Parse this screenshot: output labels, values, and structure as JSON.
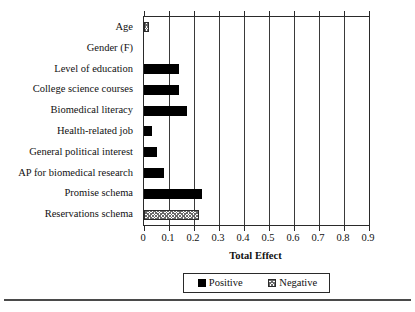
{
  "chart_data": {
    "type": "bar",
    "orientation": "horizontal",
    "title": "",
    "xlabel": "Total Effect",
    "ylabel": "",
    "xlim": [
      0,
      0.9
    ],
    "xticks": [
      0,
      0.1,
      0.2,
      0.3,
      0.4,
      0.5,
      0.6,
      0.7,
      0.8,
      0.9
    ],
    "xtick_labels": [
      "0",
      "0.1",
      "0.2",
      "0.3",
      "0.4",
      "0.5",
      "0.6",
      "0.7",
      "0.8",
      "0.9"
    ],
    "grid": "vertical",
    "legend_position": "bottom",
    "categories": [
      "Age",
      "Gender (F)",
      "Level of education",
      "College science courses",
      "Biomedical literacy",
      "Health-related job",
      "General political interest",
      "AP for biomedical research",
      "Promise schema",
      "Reservations schema"
    ],
    "values": [
      0.02,
      0.0,
      0.14,
      0.14,
      0.17,
      0.03,
      0.05,
      0.08,
      0.23,
      0.22
    ],
    "signs": [
      "negative",
      "none",
      "positive",
      "positive",
      "positive",
      "positive",
      "positive",
      "positive",
      "positive",
      "negative"
    ],
    "legend": [
      {
        "label": "Positive",
        "key": "positive",
        "color": "#000000"
      },
      {
        "label": "Negative",
        "key": "negative",
        "color": "#ffffff"
      }
    ]
  }
}
